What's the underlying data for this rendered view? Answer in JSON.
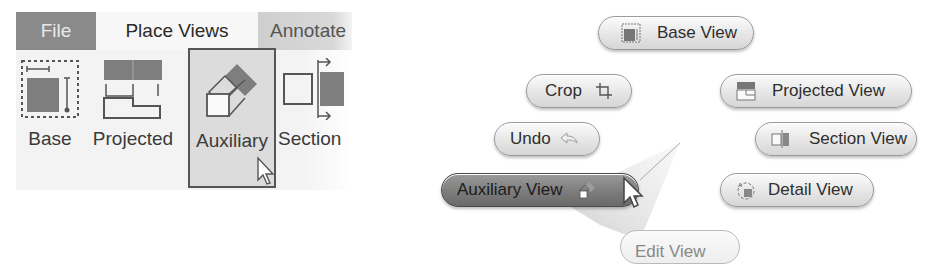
{
  "ribbon": {
    "tabs": [
      {
        "label": "File",
        "state": "dark"
      },
      {
        "label": "Place Views",
        "state": "active"
      },
      {
        "label": "Annotate",
        "state": "inactive"
      }
    ],
    "buttons": [
      {
        "label": "Base",
        "icon": "base-view-icon"
      },
      {
        "label": "Projected",
        "icon": "projected-view-icon"
      },
      {
        "label": "Auxiliary",
        "icon": "auxiliary-view-icon",
        "state": "hovered"
      },
      {
        "label": "Section",
        "icon": "section-view-icon"
      }
    ]
  },
  "marking_menu": {
    "items": [
      {
        "label": "Base View",
        "icon": "base-view-icon",
        "position": "north"
      },
      {
        "label": "Crop",
        "icon": "crop-icon",
        "position": "north-west"
      },
      {
        "label": "Projected View",
        "icon": "projected-view-icon",
        "position": "north-east"
      },
      {
        "label": "Undo",
        "icon": "undo-arrow-icon",
        "position": "west-upper"
      },
      {
        "label": "Section View",
        "icon": "section-view-icon",
        "position": "east-upper"
      },
      {
        "label": "Auxiliary View",
        "icon": "auxiliary-view-icon",
        "position": "west",
        "state": "highlighted"
      },
      {
        "label": "Detail View",
        "icon": "detail-view-icon",
        "position": "east"
      },
      {
        "label": "Edit View",
        "icon": "",
        "position": "south"
      }
    ]
  },
  "colors": {
    "tab_file_bg": "#8a8a8a",
    "ribbon_bg": "#f3f3f3",
    "highlight_pill": "#7a7a7a",
    "pill_bg": "#e6e6e6"
  }
}
